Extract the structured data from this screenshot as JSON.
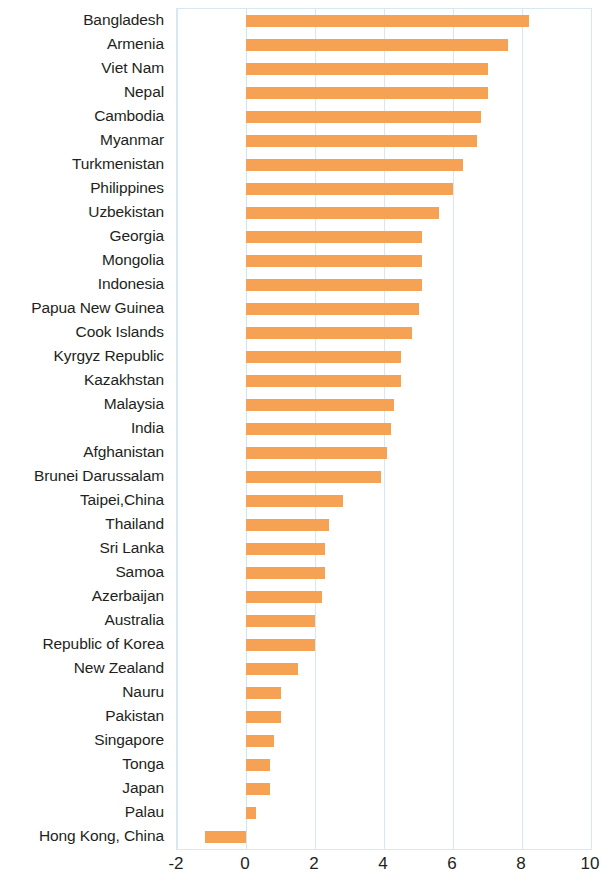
{
  "chart_data": {
    "type": "bar",
    "orientation": "horizontal",
    "title": "",
    "subtitle": "",
    "xlabel": "",
    "ylabel": "",
    "xlim": [
      -2,
      10
    ],
    "xticks": [
      -2,
      0,
      2,
      4,
      6,
      8,
      10
    ],
    "xtick_labels": [
      "-2",
      "0",
      "2",
      "4",
      "6",
      "8",
      "10"
    ],
    "grid": true,
    "legend": null,
    "bar_color": "#f6a255",
    "grid_color": "#d6e9f2",
    "categories": [
      "Bangladesh",
      "Armenia",
      "Viet Nam",
      "Nepal",
      "Cambodia",
      "Myanmar",
      "Turkmenistan",
      "Philippines",
      "Uzbekistan",
      "Georgia",
      "Mongolia",
      "Indonesia",
      "Papua New Guinea",
      "Cook Islands",
      "Kyrgyz Republic",
      "Kazakhstan",
      "Malaysia",
      "India",
      "Afghanistan",
      "Brunei Darussalam",
      "Taipei,China",
      "Thailand",
      "Sri Lanka",
      "Samoa",
      "Azerbaijan",
      "Australia",
      "Republic of Korea",
      "New Zealand",
      "Nauru",
      "Pakistan",
      "Singapore",
      "Tonga",
      "Japan",
      "Palau",
      "Hong Kong, China"
    ],
    "values": [
      8.2,
      7.6,
      7.0,
      7.0,
      6.8,
      6.7,
      6.3,
      6.0,
      5.6,
      5.1,
      5.1,
      5.1,
      5.0,
      4.8,
      4.5,
      4.5,
      4.3,
      4.2,
      4.1,
      3.9,
      2.8,
      2.4,
      2.3,
      2.3,
      2.2,
      2.0,
      2.0,
      1.5,
      1.0,
      1.0,
      0.8,
      0.7,
      0.7,
      0.3,
      -1.2
    ]
  }
}
